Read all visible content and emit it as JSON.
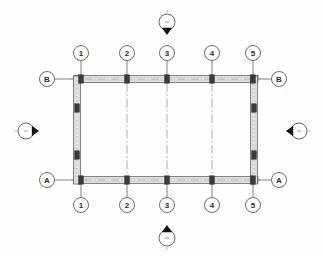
{
  "drawing": {
    "type": "structural-grid-floor-plan",
    "background_color": "#fdfdfd",
    "line_color": "#4a4a4a",
    "grid_line_color": "#9a9a9a",
    "wall_fill_color": "#cfcfcf",
    "column_fill_color": "#3a3a3a",
    "bubble_stroke_color": "#555555",
    "marker_fill_color": "#111111"
  },
  "column_grid": {
    "vertical_labels_top": [
      "1",
      "2",
      "3",
      "4",
      "5"
    ],
    "vertical_labels_bottom": [
      "1",
      "2",
      "3",
      "4",
      "5"
    ],
    "vertical_x": [
      81,
      127,
      167,
      212,
      253
    ],
    "horizontal_labels_left": [
      "B",
      "A"
    ],
    "horizontal_labels_right": [
      "B",
      "A"
    ],
    "horizontal_y": [
      79,
      180
    ],
    "bubble_radius": 7.5,
    "bubble_row_top_y": 53,
    "bubble_row_bottom_y": 205,
    "bubble_col_left_x": 47,
    "bubble_col_right_x": 279
  },
  "walls": {
    "top": {
      "x1": 74,
      "y": 79,
      "x2": 258,
      "thickness": 7
    },
    "bottom": {
      "x1": 74,
      "y": 180,
      "x2": 258,
      "thickness": 7
    },
    "left": {
      "x": 77,
      "y1": 76,
      "y2": 184,
      "thickness": 7
    },
    "right": {
      "x": 254,
      "y1": 76,
      "y2": 184,
      "thickness": 7
    }
  },
  "columns": [
    {
      "label": "B1",
      "x": 81,
      "y": 79
    },
    {
      "label": "B2",
      "x": 127,
      "y": 79
    },
    {
      "label": "B3",
      "x": 167,
      "y": 79
    },
    {
      "label": "B4",
      "x": 212,
      "y": 79
    },
    {
      "label": "B5",
      "x": 253,
      "y": 79
    },
    {
      "label": "A1",
      "x": 81,
      "y": 180
    },
    {
      "label": "A2",
      "x": 127,
      "y": 180
    },
    {
      "label": "A3",
      "x": 167,
      "y": 180
    },
    {
      "label": "A4",
      "x": 212,
      "y": 180
    },
    {
      "label": "A5",
      "x": 253,
      "y": 180
    },
    {
      "label": "L-mid-upper",
      "x": 77,
      "y": 108
    },
    {
      "label": "L-mid-lower",
      "x": 77,
      "y": 155
    },
    {
      "label": "R-mid-upper",
      "x": 254,
      "y": 108
    },
    {
      "label": "R-mid-lower",
      "x": 254,
      "y": 155
    }
  ],
  "section_markers": [
    {
      "name": "section-marker-top",
      "cx": 167,
      "cy": 22,
      "radius": 8,
      "direction": "down",
      "label": ""
    },
    {
      "name": "section-marker-bottom",
      "cx": 167,
      "cy": 238,
      "radius": 8,
      "direction": "up",
      "label": ""
    },
    {
      "name": "section-marker-left",
      "cx": 26,
      "cy": 131,
      "radius": 8,
      "direction": "right",
      "label": ""
    },
    {
      "name": "section-marker-right",
      "cx": 299,
      "cy": 131,
      "radius": 8,
      "direction": "left",
      "label": ""
    }
  ],
  "interior_grid_lines": [
    {
      "label": "2",
      "x": 127,
      "y1": 83,
      "y2": 178
    },
    {
      "label": "3",
      "x": 167,
      "y1": 83,
      "y2": 178
    },
    {
      "label": "4",
      "x": 212,
      "y1": 83,
      "y2": 178
    }
  ],
  "extension_lines": {
    "vertical_top_y1": 60,
    "vertical_top_y2": 79,
    "vertical_bottom_y1": 180,
    "vertical_bottom_y2": 198,
    "horizontal_left_x1": 55,
    "horizontal_left_x2": 80,
    "horizontal_right_x1": 254,
    "horizontal_right_x2": 271
  }
}
